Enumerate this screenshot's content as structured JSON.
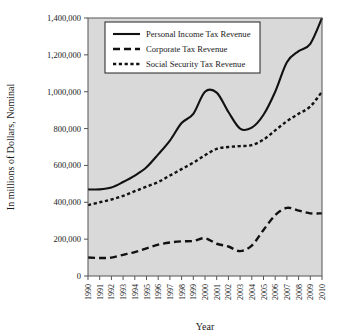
{
  "figure": {
    "background_color": "#ffffff",
    "plot_background_color": "#d9d9d9",
    "frame_color": "#555555",
    "series_color": "#111111"
  },
  "chart_data": {
    "type": "line",
    "title": "",
    "xlabel": "Year",
    "ylabel": "In millions of Dollars, Nominal",
    "grid": false,
    "legend_position": "top-center-inside",
    "xlim": [
      1990,
      2010
    ],
    "ylim": [
      0,
      1400000
    ],
    "ytick_values": [
      0,
      200000,
      400000,
      600000,
      800000,
      1000000,
      1200000,
      1400000
    ],
    "ytick_labels": [
      "0",
      "200,000",
      "400,000",
      "600,000",
      "800,000",
      "1,000,000",
      "1,200,000",
      "1,400,000"
    ],
    "x": [
      1990,
      1991,
      1992,
      1993,
      1994,
      1995,
      1996,
      1997,
      1998,
      1999,
      2000,
      2001,
      2002,
      2003,
      2004,
      2005,
      2006,
      2007,
      2008,
      2009,
      2010
    ],
    "categories": [
      "1990",
      "1991",
      "1992",
      "1993",
      "1994",
      "1995",
      "1996",
      "1997",
      "1998",
      "1999",
      "2000",
      "2001",
      "2002",
      "2003",
      "2004",
      "2005",
      "2006",
      "2007",
      "2008",
      "2009",
      "2010"
    ],
    "series": [
      {
        "name": "Personal Income Tax Revenue",
        "dash": "none",
        "width": 2.1,
        "values": [
          470000,
          470000,
          480000,
          510000,
          545000,
          590000,
          660000,
          735000,
          830000,
          880000,
          1000000,
          995000,
          890000,
          800000,
          805000,
          875000,
          1000000,
          1160000,
          1220000,
          1260000,
          1400000
        ]
      },
      {
        "name": "Corporate Tax Revenue",
        "dash": "long",
        "width": 2.4,
        "values": [
          100000,
          98000,
          100000,
          115000,
          130000,
          150000,
          170000,
          182000,
          188000,
          190000,
          205000,
          175000,
          160000,
          135000,
          165000,
          250000,
          330000,
          370000,
          355000,
          340000,
          340000
        ]
      },
      {
        "name": "Social Security Tax Revenue",
        "dash": "short",
        "width": 2.4,
        "values": [
          385000,
          400000,
          415000,
          435000,
          460000,
          485000,
          510000,
          545000,
          580000,
          615000,
          655000,
          690000,
          700000,
          705000,
          710000,
          740000,
          790000,
          840000,
          880000,
          920000,
          1000000
        ]
      }
    ]
  }
}
